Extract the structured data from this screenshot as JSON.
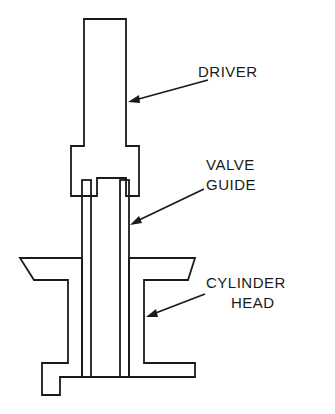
{
  "diagram": {
    "labels": {
      "driver": "DRIVER",
      "valve_guide_line1": "VALVE",
      "valve_guide_line2": "GUIDE",
      "cylinder_head_line1": "CYLINDER",
      "cylinder_head_line2": "HEAD"
    },
    "colors": {
      "ink": "#1a1a1a",
      "background": "#ffffff"
    }
  }
}
